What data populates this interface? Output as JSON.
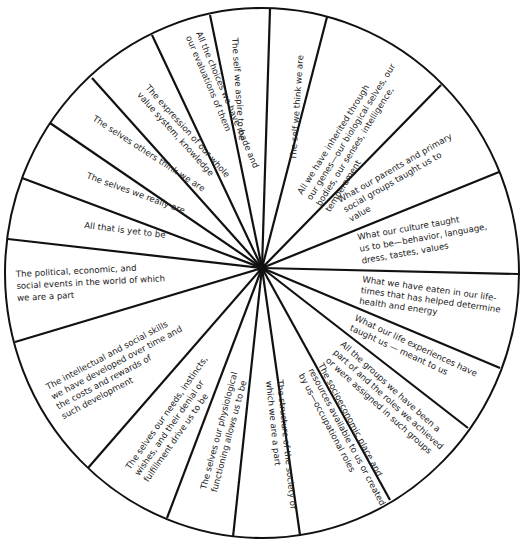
{
  "diagram": {
    "type": "wheel",
    "center": [
      262,
      268
    ],
    "colors": {
      "line": "#111111",
      "text": "#222222",
      "background": "#ffffff"
    },
    "segments": [
      {
        "id": "aspire",
        "lines": [
          "The self we aspire to be"
        ]
      },
      {
        "id": "think",
        "lines": [
          "The self we think we are"
        ]
      },
      {
        "id": "inherited",
        "lines": [
          "All we have inherited through",
          "our genes—our biological selves, our",
          "bodies, our senses, intelligence,",
          "temperament"
        ]
      },
      {
        "id": "parents",
        "lines": [
          "What our parents and primary",
          "social groups taught us to",
          "value"
        ]
      },
      {
        "id": "culture",
        "lines": [
          "What our culture taught",
          "us to be—behavior, language,",
          "dress, tastes, values"
        ]
      },
      {
        "id": "eaten",
        "lines": [
          "What we have eaten in our life-",
          "times that has helped determine",
          "health and energy"
        ]
      },
      {
        "id": "experiences",
        "lines": [
          "What our life experiences have",
          "taught us — meant to us"
        ]
      },
      {
        "id": "groups",
        "lines": [
          "All the groups we have been a",
          "part of and the roles we achieved",
          "or were assigned in such groups"
        ]
      },
      {
        "id": "socioeconomic",
        "lines": [
          "The socioeconomic place and",
          "resources available to us or created",
          "by us—occupational roles"
        ]
      },
      {
        "id": "structure",
        "lines": [
          "The structure of the society of",
          "which we are a part"
        ]
      },
      {
        "id": "physiological",
        "lines": [
          "The selves our physiological",
          "functioning allows us to be"
        ]
      },
      {
        "id": "needs",
        "lines": [
          "The selves our needs, instincts,",
          "wishes, and their denial or",
          "fulfillment  drive us to be"
        ]
      },
      {
        "id": "skills",
        "lines": [
          "The intellectual and social skills",
          "we have developed over time and",
          "the costs and rewards of",
          "such development"
        ]
      },
      {
        "id": "political",
        "lines": [
          "The political, economic, and",
          "social events in the world of which",
          "we are a part"
        ]
      },
      {
        "id": "yet",
        "lines": [
          "All that is yet to be"
        ]
      },
      {
        "id": "really",
        "lines": [
          "The selves we really are"
        ]
      },
      {
        "id": "others",
        "lines": [
          "The selves others think we are"
        ]
      },
      {
        "id": "expression",
        "lines": [
          "The expression of our whole",
          "value system, knowledge"
        ]
      },
      {
        "id": "choices",
        "lines": [
          "All the choices we have made and",
          "our evaluations of them"
        ]
      }
    ]
  }
}
